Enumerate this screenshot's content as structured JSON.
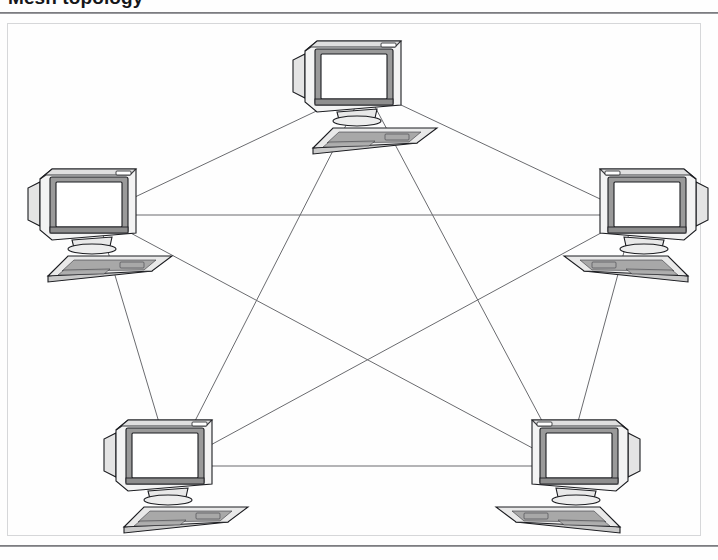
{
  "figure": {
    "caption": "Mesh topology",
    "alt_description": "Five computer workstations fully interconnected",
    "frame_visible": true,
    "rule_color": "#6f7074",
    "line_color": "#6a6b6f",
    "background": "#ffffff"
  },
  "diagram": {
    "type": "network-topology",
    "topology_name": "full mesh",
    "node_count": 5,
    "link_count": 10,
    "node_icon": "computer-workstation-icon",
    "nodes": [
      {
        "id": "n1",
        "label": "",
        "position": "top",
        "x": 365,
        "y": 88,
        "facing": "right"
      },
      {
        "id": "n2",
        "label": "",
        "position": "left",
        "x": 97,
        "y": 215,
        "facing": "right"
      },
      {
        "id": "n3",
        "label": "",
        "position": "right",
        "x": 634,
        "y": 215,
        "facing": "left"
      },
      {
        "id": "n4",
        "label": "",
        "position": "bottom-left",
        "x": 172,
        "y": 466,
        "facing": "right"
      },
      {
        "id": "n5",
        "label": "",
        "position": "bottom-right",
        "x": 566,
        "y": 466,
        "facing": "left"
      }
    ],
    "links": [
      {
        "from": "n1",
        "to": "n2"
      },
      {
        "from": "n1",
        "to": "n3"
      },
      {
        "from": "n1",
        "to": "n4"
      },
      {
        "from": "n1",
        "to": "n5"
      },
      {
        "from": "n2",
        "to": "n3"
      },
      {
        "from": "n2",
        "to": "n4"
      },
      {
        "from": "n2",
        "to": "n5"
      },
      {
        "from": "n3",
        "to": "n4"
      },
      {
        "from": "n3",
        "to": "n5"
      },
      {
        "from": "n4",
        "to": "n5"
      }
    ]
  }
}
